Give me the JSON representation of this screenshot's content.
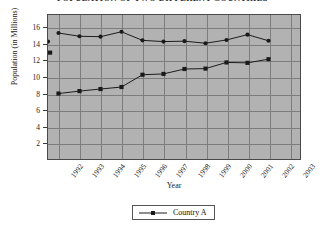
{
  "chart_data": {
    "type": "line",
    "title": "POPULATION OF TWO DIFFERENT COUNTRIES",
    "xlabel": "Year",
    "ylabel": "Population (in Millions)",
    "x": [
      1992,
      1993,
      1994,
      1995,
      1996,
      1997,
      1998,
      1999,
      2000,
      2001,
      2002
    ],
    "categories": [
      "1992",
      "1993",
      "1994",
      "1995",
      "1996",
      "1997",
      "1998",
      "1999",
      "2000",
      "2001",
      "2002",
      "2003"
    ],
    "xlim": [
      1991.5,
      2003.5
    ],
    "ylim": [
      0,
      17.6
    ],
    "y_ticks": [
      2,
      4,
      6,
      8,
      10,
      12,
      14,
      16
    ],
    "grid": true,
    "legend_position": "bottom-center",
    "series": [
      {
        "name": "Country B",
        "color": "#1a1a1a",
        "marker": "circle",
        "values": [
          15.4,
          15.0,
          14.95,
          15.55,
          14.5,
          14.35,
          14.4,
          14.15,
          14.55,
          15.2,
          14.45,
          14.35
        ]
      },
      {
        "name": "Country A",
        "color": "#1a1a1a",
        "marker": "square",
        "values": [
          8.0,
          8.3,
          8.55,
          8.8,
          10.3,
          10.4,
          11.0,
          11.05,
          11.8,
          11.75,
          12.2,
          13.0
        ]
      }
    ]
  },
  "legend": {
    "entries": [
      {
        "label": "Country A"
      }
    ]
  }
}
